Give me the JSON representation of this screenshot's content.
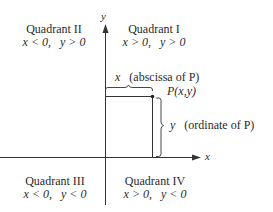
{
  "axes": {
    "x_label": "x",
    "y_label": "y"
  },
  "quadrants": [
    {
      "name": "Quadrant I",
      "condition": "x > 0,   y > 0"
    },
    {
      "name": "Quadrant II",
      "condition": "x < 0,   y > 0"
    },
    {
      "name": "Quadrant III",
      "condition": "x < 0,   y < 0"
    },
    {
      "name": "Quadrant IV",
      "condition": "x > 0,   y < 0"
    }
  ],
  "point": {
    "label": "P(x,y)"
  },
  "annotations": {
    "abscissa_var": "x",
    "abscissa_text": "(abscissa of P)",
    "ordinate_var": "y",
    "ordinate_text": "(ordinate of P)"
  },
  "colors": {
    "line": "#333333",
    "background": "#ffffff"
  }
}
